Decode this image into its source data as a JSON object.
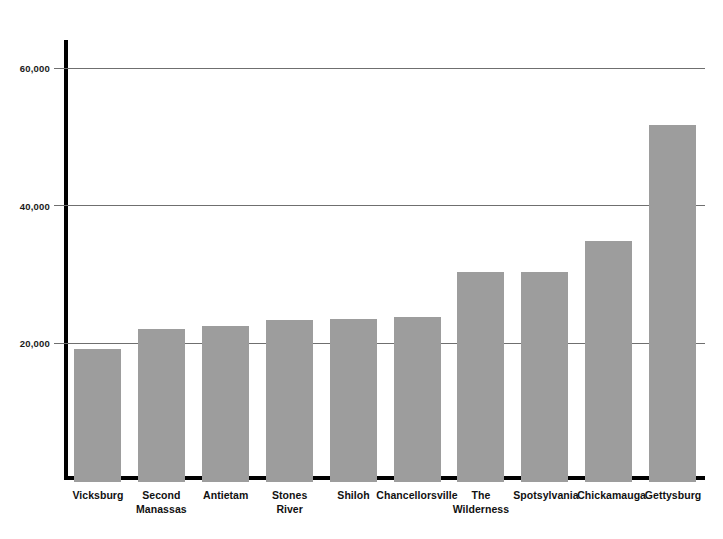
{
  "chart_data": {
    "type": "bar",
    "title": "",
    "subtitle": "",
    "xlabel": "",
    "ylabel": "",
    "categories": [
      "Vicksburg",
      "Second Manassas",
      "Antietam",
      "Stones River",
      "Shiloh",
      "Chancellorsville",
      "The Wilderness",
      "Spotsylvania",
      "Chickamauga",
      "Gettysburg"
    ],
    "category_lines": [
      [
        "Vicksburg"
      ],
      [
        "Second",
        "Manassas"
      ],
      [
        "Antietam"
      ],
      [
        "Stones",
        "River"
      ],
      [
        "Shiloh"
      ],
      [
        "Chancellorsville"
      ],
      [
        "The",
        "Wilderness"
      ],
      [
        "Spotsylvania"
      ],
      [
        "Chickamauga"
      ],
      [
        "Gettysburg"
      ]
    ],
    "values": [
      19400,
      22200,
      22700,
      23500,
      23700,
      24000,
      30500,
      30500,
      35000,
      52000
    ],
    "series": [
      {
        "name": "Casualties",
        "values": [
          19400,
          22200,
          22700,
          23500,
          23700,
          24000,
          30500,
          30500,
          35000,
          52000
        ]
      }
    ],
    "ylim": [
      0,
      64000
    ],
    "yticks": [
      20000,
      40000,
      60000
    ],
    "ytick_labels": [
      "20,000",
      "40,000",
      "60,000"
    ],
    "grid": true,
    "legend": false,
    "bar_color": "#9d9d9d",
    "axis_color": "#000000",
    "gridline_color": "#6f6f6f",
    "background_color": "#ffffff"
  },
  "axis": {
    "y_ticks": [
      {
        "label": "60,000",
        "value": 60000
      },
      {
        "label": "40,000",
        "value": 40000
      },
      {
        "label": "20,000",
        "value": 20000
      }
    ]
  }
}
